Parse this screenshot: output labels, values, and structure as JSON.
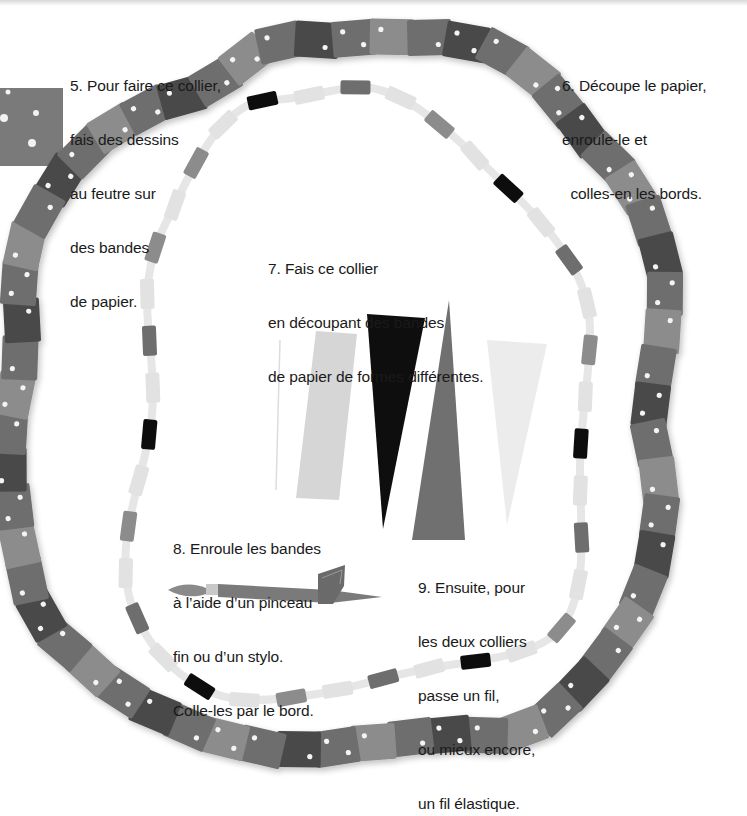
{
  "colors": {
    "background": "#ffffff",
    "bead_dark": "#4a4a4a",
    "bead_mid": "#6e6e6e",
    "bead_light": "#8c8c8c",
    "bead_pale": "#e2e2e2",
    "bead_black": "#111111",
    "text": "#1a1a1a"
  },
  "steps": [
    {
      "number": "5",
      "lines": [
        "5. Pour faire ce collier,",
        "fais des dessins",
        "au feutre sur",
        "des bandes",
        "de papier."
      ]
    },
    {
      "number": "6",
      "lines": [
        "6. Découpe le papier,",
        "enroule-le et",
        "  colles-en les bords."
      ]
    },
    {
      "number": "7",
      "lines": [
        "7. Fais ce collier",
        "en découpant des bandes",
        "de papier de formes différentes."
      ]
    },
    {
      "number": "8",
      "lines": [
        "8. Enroule les bandes",
        "à l’aide d’un pinceau",
        "fin ou d’un stylo.",
        "Colle-les par le bord."
      ]
    },
    {
      "number": "9",
      "lines": [
        "9. Ensuite, pour",
        "les deux colliers",
        "passe un fil,",
        "ou mieux encore,",
        "un fil élastique."
      ]
    }
  ],
  "illustrations": {
    "outer_necklace": "dotted-paper-bead-necklace",
    "inner_necklace": "mixed-paper-bead-necklace",
    "paper_shapes": [
      "light-strip",
      "black-triangle",
      "grey-triangle",
      "pale-triangle"
    ],
    "tool": "paintbrush-with-paper-strip",
    "swatch": "dotted-paper-swatch"
  }
}
